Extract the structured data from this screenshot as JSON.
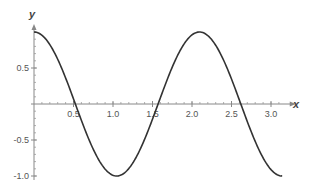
{
  "chart_data": {
    "type": "line",
    "title": "",
    "xlabel": "x",
    "ylabel": "y",
    "function": "cos(3x)",
    "xlim": [
      0,
      3.1416
    ],
    "ylim": [
      -1.0,
      1.0
    ],
    "grid": false,
    "x_ticks": [
      0.5,
      1.0,
      1.5,
      2.0,
      2.5,
      3.0
    ],
    "x_tick_labels": [
      "0.5",
      "1.0",
      "1.5",
      "2.0",
      "2.5",
      "3.0"
    ],
    "y_ticks": [
      0.5,
      -0.5,
      -1.0
    ],
    "y_tick_labels": [
      "0.5",
      "-0.5",
      "-1.0"
    ],
    "series": [
      {
        "name": "y",
        "color": "#333333",
        "x": [
          0,
          0.1,
          0.2,
          0.3,
          0.4,
          0.5236,
          0.6,
          0.7,
          0.8,
          0.9,
          1.0472,
          1.1,
          1.2,
          1.3,
          1.4,
          1.5708,
          1.6,
          1.7,
          1.8,
          1.9,
          2.0944,
          2.2,
          2.3,
          2.4,
          2.5,
          2.618,
          2.7,
          2.8,
          2.9,
          3.0,
          3.1416
        ],
        "y": [
          1.0,
          0.955,
          0.825,
          0.622,
          0.362,
          0.0,
          -0.227,
          -0.505,
          -0.737,
          -0.904,
          -1.0,
          -0.988,
          -0.897,
          -0.726,
          -0.49,
          0.0,
          0.087,
          0.378,
          0.635,
          0.839,
          1.0,
          0.965,
          0.812,
          0.608,
          0.347,
          0.0,
          -0.243,
          -0.52,
          -0.75,
          -0.911,
          -1.0
        ]
      }
    ]
  },
  "axes": {
    "x_label": "x",
    "y_label": "y"
  }
}
